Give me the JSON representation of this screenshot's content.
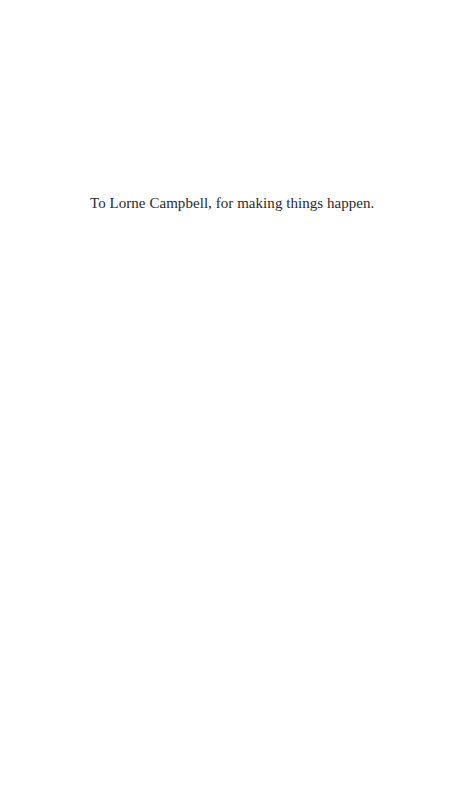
{
  "page": {
    "dedication": "To Lorne Campbell, for making things happen."
  }
}
